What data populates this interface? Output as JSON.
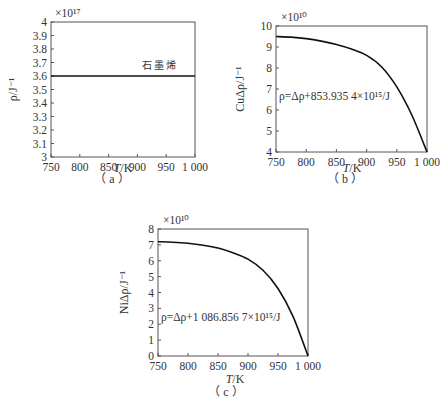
{
  "chart_data": [
    {
      "id": "a",
      "type": "line",
      "caption": "（ a ）",
      "title": "",
      "xlabel": "T/K",
      "ylabel": "ρ/J⁻¹",
      "y_multiplier": "×10¹⁷",
      "xlim": [
        750,
        1000
      ],
      "ylim": [
        3,
        4
      ],
      "xticks": [
        750,
        800,
        850,
        900,
        950,
        1000
      ],
      "xtick_labels": [
        "750",
        "800",
        "850",
        "900",
        "950",
        "1 000"
      ],
      "yticks": [
        3,
        3.1,
        3.2,
        3.3,
        3.4,
        3.5,
        3.6,
        3.7,
        3.8,
        3.9,
        4
      ],
      "ytick_labels": [
        "3",
        "3.1",
        "3.2",
        "3.3",
        "3.4",
        "3.5",
        "3.6",
        "3.7",
        "3.8",
        "3.9",
        "4"
      ],
      "series": [
        {
          "name": "石墨烯",
          "x": [
            750,
            1000
          ],
          "values": [
            3.6,
            3.6
          ]
        }
      ],
      "annotations": [
        {
          "text": "石墨烯",
          "x": 940,
          "y": 3.65
        }
      ],
      "grid": false
    },
    {
      "id": "b",
      "type": "line",
      "caption": "（ b ）",
      "title": "",
      "xlabel": "T/K",
      "ylabel": "CuΔρ/J⁻¹",
      "y_multiplier": "×10¹⁰",
      "xlim": [
        750,
        1000
      ],
      "ylim": [
        4,
        10
      ],
      "xticks": [
        750,
        800,
        850,
        900,
        950,
        1000
      ],
      "xtick_labels": [
        "750",
        "800",
        "850",
        "900",
        "950",
        "1 000"
      ],
      "yticks": [
        4,
        5,
        6,
        7,
        8,
        9,
        10
      ],
      "ytick_labels": [
        "4",
        "5",
        "6",
        "7",
        "8",
        "9",
        "10"
      ],
      "series": [
        {
          "name": "Cu",
          "x": [
            750,
            775,
            800,
            825,
            850,
            875,
            900,
            925,
            950,
            975,
            1000
          ],
          "values": [
            9.5,
            9.47,
            9.4,
            9.28,
            9.12,
            8.9,
            8.6,
            8.05,
            7.1,
            5.75,
            4.0
          ]
        }
      ],
      "annotations": [
        {
          "text": "ρ=Δρ+853.935 4×10¹⁵/J",
          "x": 755,
          "y": 6.5
        }
      ],
      "grid": false
    },
    {
      "id": "c",
      "type": "line",
      "caption": "（ c ）",
      "title": "",
      "xlabel": "T/K",
      "ylabel": "NiΔρ/J⁻¹",
      "y_multiplier": "×10¹⁰",
      "xlim": [
        750,
        1000
      ],
      "ylim": [
        0,
        8
      ],
      "xticks": [
        750,
        800,
        850,
        900,
        950,
        1000
      ],
      "xtick_labels": [
        "750",
        "800",
        "850",
        "900",
        "950",
        "1 000"
      ],
      "yticks": [
        0,
        1,
        2,
        3,
        4,
        5,
        6,
        7,
        8
      ],
      "ytick_labels": [
        "0",
        "1",
        "2",
        "3",
        "4",
        "5",
        "6",
        "7",
        "8"
      ],
      "series": [
        {
          "name": "Ni",
          "x": [
            750,
            775,
            800,
            825,
            850,
            875,
            900,
            925,
            950,
            975,
            1000
          ],
          "values": [
            7.2,
            7.17,
            7.1,
            6.98,
            6.8,
            6.5,
            6.1,
            5.4,
            4.25,
            2.5,
            0.0
          ]
        }
      ],
      "annotations": [
        {
          "text": "ρ=Δρ+1 086.856 7×10¹⁵/J",
          "x": 755,
          "y": 2.2
        }
      ],
      "grid": false
    }
  ]
}
